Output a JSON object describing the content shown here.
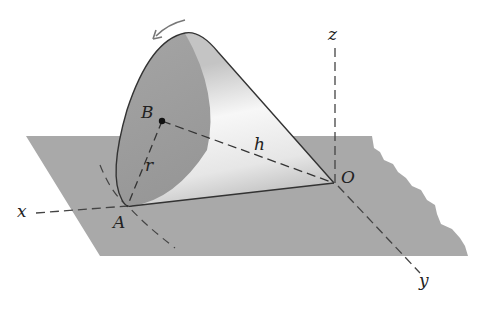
{
  "figure": {
    "colors": {
      "plane": "#a9a9a9",
      "cone_base": "#9c9c9c",
      "cone_side_light": "#f2f2f2",
      "cone_side_shadow": "#b8b8b8",
      "outline": "#333333",
      "dashed": "#444444",
      "arrow": "#777777"
    },
    "labels": {
      "z_axis": "z",
      "x_axis": "x",
      "y_axis": "y",
      "origin": "O",
      "point_A": "A",
      "point_B": "B",
      "height": "h",
      "radius": "r"
    },
    "elements": {
      "axes": [
        "x",
        "y",
        "z"
      ],
      "points": [
        "O",
        "A",
        "B"
      ],
      "segments": [
        {
          "from": "B",
          "to": "O",
          "label": "h",
          "style": "dashed"
        },
        {
          "from": "B",
          "to": "A",
          "label": "r",
          "style": "dashed"
        }
      ],
      "rotation_arrow": "counter-clockwise arrow over cone base rim"
    }
  }
}
